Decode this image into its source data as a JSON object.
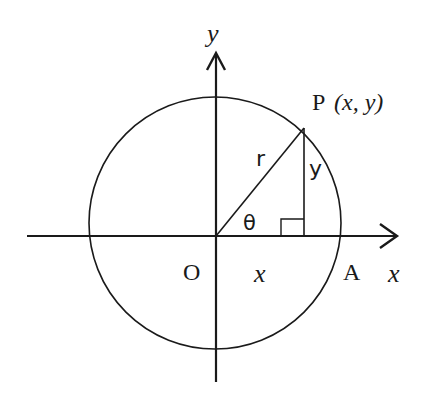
{
  "diagram": {
    "colors": {
      "stroke": "#1a1a1a",
      "background": "#ffffff"
    },
    "labels": {
      "y_axis": "y",
      "x_axis": "x",
      "origin": "O",
      "point_p": "P",
      "point_p_coords": "(x, y)",
      "radius": "r",
      "opposite_side": "y",
      "adjacent_side": "x",
      "angle": "θ",
      "point_a": "A"
    }
  }
}
